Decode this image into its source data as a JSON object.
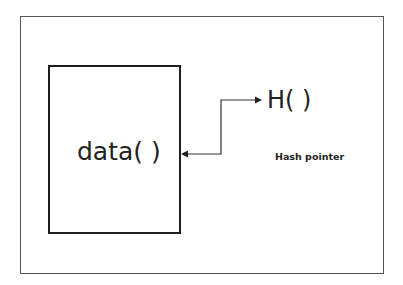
{
  "diagram": {
    "title": "",
    "nodes": {
      "data_block": {
        "label": "data( )"
      },
      "hash_function": {
        "label": "H( )"
      }
    },
    "edges": [
      {
        "from": "hash_function",
        "to": "data_block",
        "style": "bidirectional-arrow",
        "label": "Hash pointer"
      }
    ],
    "annotations": {
      "hash_pointer_label": "Hash pointer"
    },
    "colors": {
      "frame": "#555555",
      "box_border": "#1e1e1e",
      "text": "#222222",
      "connector": "#333333"
    }
  }
}
